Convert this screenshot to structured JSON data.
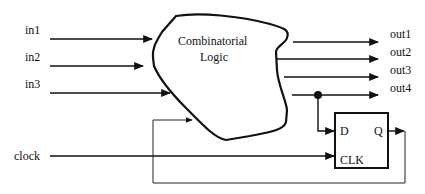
{
  "diagram": {
    "type": "sequential-circuit-block-diagram",
    "inputs": [
      {
        "label": "in1"
      },
      {
        "label": "in2"
      },
      {
        "label": "in3"
      },
      {
        "label": "clock"
      }
    ],
    "outputs": [
      {
        "label": "out1"
      },
      {
        "label": "out2"
      },
      {
        "label": "out3"
      },
      {
        "label": "out4"
      }
    ],
    "logic_block": {
      "line1": "Combinatorial",
      "line2": "Logic"
    },
    "flip_flop": {
      "d_label": "D",
      "q_label": "Q",
      "clk_label": "CLK"
    },
    "colors": {
      "stroke": "#111111",
      "background": "#ffffff"
    }
  }
}
